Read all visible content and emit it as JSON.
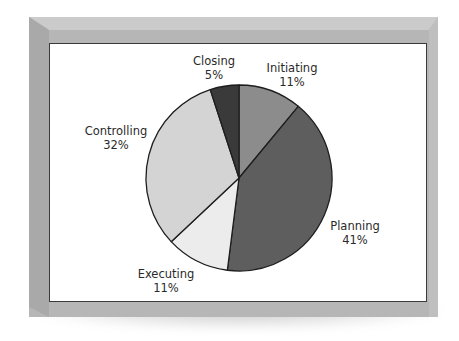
{
  "chart_data": {
    "type": "pie",
    "title": "",
    "categories": [
      "Initiating",
      "Planning",
      "Executing",
      "Controlling",
      "Closing"
    ],
    "values": [
      11,
      41,
      11,
      32,
      5
    ],
    "value_labels": [
      "11%",
      "41%",
      "11%",
      "32%",
      "5%"
    ],
    "colors": [
      "#8c8c8c",
      "#5e5e5e",
      "#ececec",
      "#d4d4d4",
      "#3a3a3a"
    ],
    "start_angle_deg": 0,
    "direction": "clockwise",
    "legend": "none (labels placed beside slices)"
  },
  "labels": {
    "initiating": {
      "name": "Initiating",
      "pct": "11%"
    },
    "planning": {
      "name": "Planning",
      "pct": "41%"
    },
    "executing": {
      "name": "Executing",
      "pct": "11%"
    },
    "controlling": {
      "name": "Controlling",
      "pct": "32%"
    },
    "closing": {
      "name": "Closing",
      "pct": "5%"
    }
  }
}
